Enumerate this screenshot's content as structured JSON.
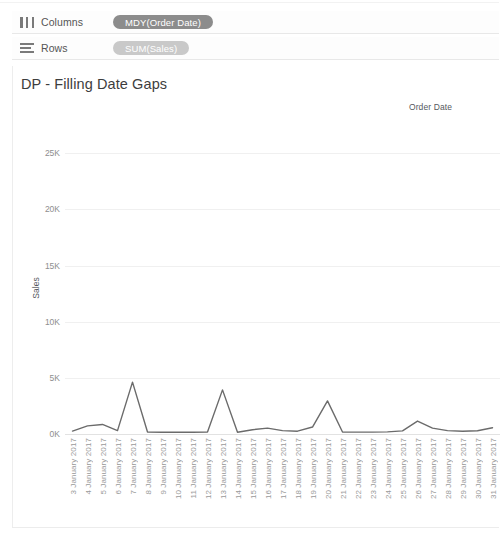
{
  "shelves": {
    "columns": {
      "label": "Columns",
      "icon": "columns-icon",
      "pill": "MDY(Order Date)"
    },
    "rows": {
      "label": "Rows",
      "icon": "rows-icon",
      "pill": "SUM(Sales)"
    }
  },
  "worksheet": {
    "title": "DP - Filling Date Gaps",
    "column_header": "Order Date"
  },
  "colors": {
    "pill_columns": "#8c8c8c",
    "pill_rows": "#c9c9c9",
    "line": "#6b6b6b",
    "grid": "#f0f0f0",
    "text": "#4a4a4a"
  },
  "chart_data": {
    "type": "line",
    "title": "DP - Filling Date Gaps",
    "xlabel": "Order Date",
    "ylabel": "Sales",
    "ylim": [
      0,
      26000
    ],
    "yticks": [
      0,
      5000,
      10000,
      15000,
      20000,
      25000
    ],
    "ytick_labels": [
      "0K",
      "5K",
      "10K",
      "15K",
      "20K",
      "25K"
    ],
    "grid": true,
    "legend": "none",
    "categories": [
      "3 January 2017",
      "4 January 2017",
      "5 January 2017",
      "6 January 2017",
      "7 January 2017",
      "8 January 2017",
      "9 January 2017",
      "10 January 2017",
      "11 January 2017",
      "12 January 2017",
      "13 January 2017",
      "14 January 2017",
      "15 January 2017",
      "16 January 2017",
      "17 January 2017",
      "18 January 2017",
      "19 January 2017",
      "20 January 2017",
      "21 January 2017",
      "22 January 2017",
      "23 January 2017",
      "24 January 2017",
      "25 January 2017",
      "26 January 2017",
      "27 January 2017",
      "28 January 2017",
      "29 January 2017",
      "30 January 2017",
      "31 January 2017"
    ],
    "series": [
      {
        "name": "SUM(Sales)",
        "values": [
          260,
          720,
          850,
          300,
          4620,
          180,
          150,
          170,
          160,
          180,
          3930,
          160,
          380,
          520,
          300,
          250,
          620,
          2950,
          180,
          170,
          170,
          190,
          280,
          1150,
          520,
          300,
          250,
          290,
          560
        ]
      }
    ]
  }
}
